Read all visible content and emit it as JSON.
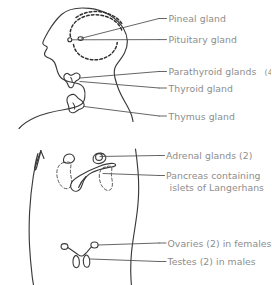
{
  "diagram": {
    "background_color": "#ffffff",
    "outline_color": "#3a3a3a",
    "label_color": "#8d8d8d",
    "leader_color": "#4a4a4a",
    "views": [
      {
        "name": "head-and-neck",
        "description": "Lateral profile of head, neck and shoulders facing left"
      },
      {
        "name": "torso",
        "description": "Abdominal and pelvic torso outline"
      }
    ],
    "labels": [
      {
        "id": "pineal",
        "text": "Pineal gland",
        "suffix": "",
        "line2": ""
      },
      {
        "id": "pituitary",
        "text": "Pituitary gland",
        "suffix": "",
        "line2": ""
      },
      {
        "id": "parathyroid",
        "text": "Parathyroid glands",
        "suffix": "(4)",
        "line2": ""
      },
      {
        "id": "thyroid",
        "text": "Thyroid gland",
        "suffix": "",
        "line2": ""
      },
      {
        "id": "thymus",
        "text": "Thymus gland",
        "suffix": "",
        "line2": ""
      },
      {
        "id": "adrenal",
        "text": "Adrenal glands (2)",
        "suffix": "",
        "line2": ""
      },
      {
        "id": "pancreas",
        "text": "Pancreas containing",
        "suffix": "",
        "line2": "islets of Langerhans"
      },
      {
        "id": "ovaries",
        "text": "Ovaries (2) in females",
        "suffix": "",
        "line2": ""
      },
      {
        "id": "testes",
        "text": "Testes (2) in males",
        "suffix": "",
        "line2": ""
      }
    ],
    "organs": [
      {
        "id": "pineal-marker",
        "name": "pineal-gland",
        "style": "small-circle-marker"
      },
      {
        "id": "pituitary-marker",
        "name": "pituitary-gland",
        "style": "small-circle-marker"
      },
      {
        "id": "brain-outline",
        "name": "brain",
        "style": "dashed-arc"
      },
      {
        "id": "thyroid-shape",
        "name": "thyroid-gland",
        "style": "butterfly-solid"
      },
      {
        "id": "thymus-shape",
        "name": "thymus-gland",
        "style": "lobed-solid"
      },
      {
        "id": "kidney-left",
        "name": "kidney",
        "style": "bean-dashed"
      },
      {
        "id": "kidney-right",
        "name": "kidney",
        "style": "bean-dashed"
      },
      {
        "id": "adrenal-left",
        "name": "adrenal-gland",
        "style": "cap-solid"
      },
      {
        "id": "adrenal-right",
        "name": "adrenal-gland",
        "style": "cap-solid"
      },
      {
        "id": "pancreas-shape",
        "name": "pancreas",
        "style": "tadpole-solid"
      },
      {
        "id": "ovary-left",
        "name": "ovary",
        "style": "small-oval"
      },
      {
        "id": "ovary-right",
        "name": "ovary",
        "style": "small-oval"
      },
      {
        "id": "testis-left",
        "name": "testis",
        "style": "pendant-oval"
      },
      {
        "id": "testis-right",
        "name": "testis",
        "style": "pendant-oval"
      }
    ]
  }
}
